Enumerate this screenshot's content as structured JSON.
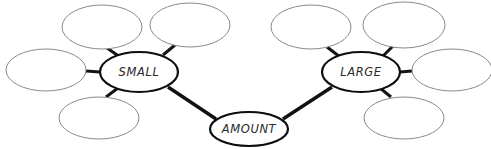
{
  "diagram": {
    "type": "concept-map",
    "background_color": "#ffffff",
    "main_stroke_color": "#0d0d0d",
    "empty_stroke_color": "#8a8a8a",
    "connector_color": "#111111",
    "label_color": "#2a2a2a",
    "root": {
      "id": "amount",
      "label": "AMOUNT",
      "cx": 249,
      "cy": 129,
      "rx": 39,
      "ry": 17
    },
    "branches": [
      {
        "id": "small",
        "label": "SMALL",
        "cx": 139,
        "cy": 72,
        "rx": 39,
        "ry": 20
      },
      {
        "id": "large",
        "label": "LARGE",
        "cx": 361,
        "cy": 72,
        "rx": 39,
        "ry": 20
      }
    ],
    "empty_nodes": [
      {
        "id": "small-sub-1",
        "cx": 102,
        "cy": 27,
        "rx": 40,
        "ry": 22
      },
      {
        "id": "small-sub-2",
        "cx": 190,
        "cy": 25,
        "rx": 40,
        "ry": 22
      },
      {
        "id": "small-sub-3",
        "cx": 46,
        "cy": 70,
        "rx": 40,
        "ry": 21
      },
      {
        "id": "small-sub-4",
        "cx": 99,
        "cy": 118,
        "rx": 40,
        "ry": 21
      },
      {
        "id": "large-sub-1",
        "cx": 311,
        "cy": 27,
        "rx": 40,
        "ry": 22
      },
      {
        "id": "large-sub-2",
        "cx": 404,
        "cy": 25,
        "rx": 41,
        "ry": 23
      },
      {
        "id": "large-sub-3",
        "cx": 452,
        "cy": 70,
        "rx": 40,
        "ry": 21
      },
      {
        "id": "large-sub-4",
        "cx": 404,
        "cy": 118,
        "rx": 40,
        "ry": 21
      }
    ],
    "connections": [
      {
        "id": "small-to-amount",
        "from": "small",
        "to": "amount",
        "x1": 168,
        "y1": 87,
        "x2": 216,
        "y2": 119,
        "weight": "thick"
      },
      {
        "id": "large-to-amount",
        "from": "large",
        "to": "amount",
        "x1": 332,
        "y1": 87,
        "x2": 283,
        "y2": 119,
        "weight": "thick"
      },
      {
        "id": "small-spoke-1",
        "from": "small",
        "to": "small-sub-1",
        "x1": 120,
        "y1": 57,
        "x2": 107,
        "y2": 48,
        "weight": "spoke"
      },
      {
        "id": "small-spoke-2",
        "from": "small",
        "to": "small-sub-2",
        "x1": 163,
        "y1": 55,
        "x2": 175,
        "y2": 45,
        "weight": "spoke"
      },
      {
        "id": "small-spoke-3",
        "from": "small",
        "to": "small-sub-3",
        "x1": 100,
        "y1": 72,
        "x2": 86,
        "y2": 71,
        "weight": "spoke"
      },
      {
        "id": "small-spoke-4",
        "from": "small",
        "to": "small-sub-4",
        "x1": 118,
        "y1": 88,
        "x2": 106,
        "y2": 97,
        "weight": "spoke"
      },
      {
        "id": "large-spoke-1",
        "from": "large",
        "to": "large-sub-1",
        "x1": 340,
        "y1": 57,
        "x2": 327,
        "y2": 47,
        "weight": "spoke"
      },
      {
        "id": "large-spoke-2",
        "from": "large",
        "to": "large-sub-2",
        "x1": 382,
        "y1": 57,
        "x2": 393,
        "y2": 46,
        "weight": "spoke"
      },
      {
        "id": "large-spoke-3",
        "from": "large",
        "to": "large-sub-3",
        "x1": 400,
        "y1": 72,
        "x2": 412,
        "y2": 71,
        "weight": "spoke"
      },
      {
        "id": "large-spoke-4",
        "from": "large",
        "to": "large-sub-4",
        "x1": 380,
        "y1": 88,
        "x2": 391,
        "y2": 97,
        "weight": "spoke"
      }
    ]
  }
}
